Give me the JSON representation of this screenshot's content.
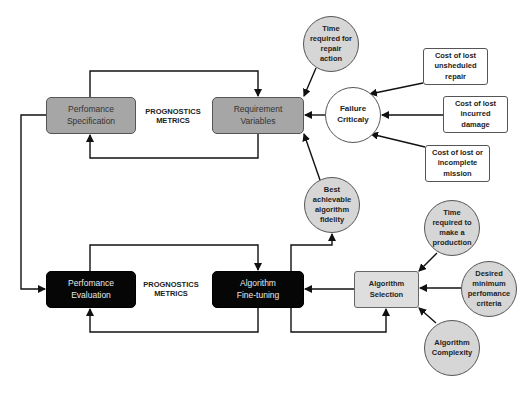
{
  "diagram": {
    "boxes": {
      "performance_specification": "Perfomance\nSpecification",
      "requirement_variables": "Requirement\nVariables",
      "performance_evaluation": "Perfomance\nEvaluation",
      "algorithm_fine_tuning": "Algorithm\nFine-tuning",
      "algorithm_selection": "Algorithm\nSelection"
    },
    "labels": {
      "prognostics_metrics_top": "PROGNOSTICS\nMETRICS",
      "prognostics_metrics_bottom": "PROGNOSTICS\nMETRICS"
    },
    "circles": {
      "time_repair": "Time\nrequired for\nrepair\naction",
      "failure_criticality": "Failure\nCriticaly",
      "best_fidelity": "Best\nachievable\nalgorithm\nfidelity",
      "time_production": "Time\nrequired to\nmake a\nproduction",
      "desired_minimum": "Desired\nminimum\nperfomance\ncriteria",
      "algorithm_complexity": "Algorithm\nComplexity"
    },
    "cost_boxes": {
      "unscheduled_repair": "Cost of lost\nunsheduled\nrepair",
      "incurred_damage": "Cost of lost\nincurred\ndamage",
      "incomplete_mission": "Cost of lost or\nincomplete\nmission"
    },
    "colors": {
      "top_boxes": "#a6a6a6",
      "bottom_boxes": "#060606",
      "selection_box": "#dedede",
      "circles": "#d6d6d6",
      "lines": "#111111"
    }
  }
}
